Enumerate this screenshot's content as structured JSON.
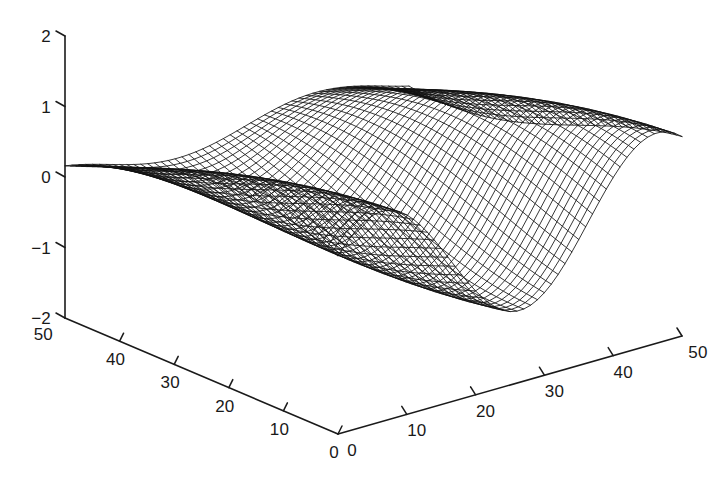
{
  "figure": {
    "width": 727,
    "height": 478,
    "background": "#ffffff",
    "line_color": "#121212",
    "axis_color": "#1a1a1a",
    "text_color": "#191919"
  },
  "chart_data": {
    "type": "surface",
    "render": "wireframe-mesh",
    "title": "",
    "subtitle": "",
    "xlabel": "",
    "ylabel": "",
    "zlabel": "",
    "grid": false,
    "legend": null,
    "projection": "3d-orthographic",
    "view": {
      "azimuth": -37.5,
      "elevation": 30
    },
    "axes": {
      "x": {
        "name": "x-axis-right",
        "min": 0,
        "max": 50,
        "ticks": [
          0,
          10,
          20,
          30,
          40,
          50
        ],
        "tick_labels": [
          "0",
          "10",
          "20",
          "30",
          "40",
          "50"
        ]
      },
      "y": {
        "name": "y-axis-left",
        "min": 0,
        "max": 50,
        "ticks": [
          0,
          10,
          20,
          30,
          40,
          50
        ],
        "tick_labels": [
          "0",
          "10",
          "20",
          "30",
          "40",
          "50"
        ]
      },
      "z": {
        "name": "z-axis-vertical",
        "min": -2,
        "max": 2,
        "ticks": [
          -2,
          -1,
          0,
          1,
          2
        ],
        "tick_labels": [
          "−2",
          "−1",
          "0",
          "1",
          "2"
        ]
      }
    },
    "surface": {
      "function": "sin-product",
      "grid_n": 50,
      "z_range": [
        -1.0,
        1.0
      ],
      "peaks_visible": 3,
      "valleys_visible": 2,
      "description": "Sinusoidal wave surface, three crests and two troughs along the ridge"
    },
    "projection_geometry": {
      "origin_px": [
        338,
        434
      ],
      "z_top_px": [
        65,
        36
      ],
      "z_bottom_px": [
        65,
        318
      ],
      "y_far_px": [
        65,
        318
      ],
      "x_far_px": [
        682,
        336
      ]
    }
  },
  "z_tick_labels": [
    "2",
    "1",
    "0",
    "−1",
    "−2"
  ],
  "y_tick_labels": [
    "50",
    "40",
    "30",
    "20",
    "10",
    "0"
  ],
  "x_tick_labels": [
    "0",
    "10",
    "20",
    "30",
    "40",
    "50"
  ]
}
